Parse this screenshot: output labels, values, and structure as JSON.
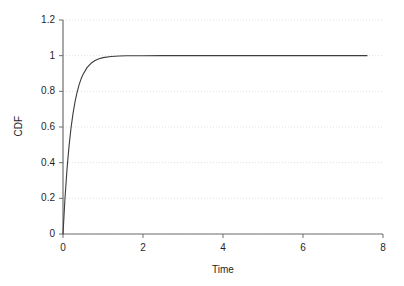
{
  "chart_data": {
    "type": "line",
    "title": "",
    "subtitle": "",
    "xlabel": "Time",
    "ylabel": "CDF",
    "xlim": [
      0,
      8
    ],
    "ylim": [
      0,
      1.2
    ],
    "xticks": [
      0,
      2,
      4,
      6,
      8
    ],
    "xtick_labels": [
      "0",
      "2",
      "4",
      "6",
      "8"
    ],
    "yticks": [
      0,
      0.2,
      0.4,
      0.6,
      0.8,
      1,
      1.2
    ],
    "ytick_labels": [
      "0",
      "0.2",
      "0.4",
      "0.6",
      "0.8",
      "1",
      "1.2"
    ],
    "grid": {
      "horizontal": true,
      "vertical": false,
      "style": "dotted",
      "color": "#d9d9d9"
    },
    "legend": {
      "visible": false,
      "position": "none",
      "entries": []
    },
    "annotations": [],
    "series": [
      {
        "name": "CDF",
        "color": "#3c3c3c",
        "line_width": 1.1,
        "formula": "1 - exp(-4.5 * t)",
        "x": [
          0,
          0.05,
          0.1,
          0.15,
          0.2,
          0.25,
          0.3,
          0.35,
          0.4,
          0.45,
          0.5,
          0.6,
          0.7,
          0.8,
          0.9,
          1,
          1.2,
          1.4,
          1.6,
          1.8,
          2,
          2.5,
          3,
          3.5,
          4,
          4.5,
          5,
          5.5,
          6,
          6.5,
          7,
          7.6
        ],
        "y": [
          0,
          0.2014,
          0.3624,
          0.4914,
          0.5934,
          0.6753,
          0.7408,
          0.7932,
          0.8352,
          0.8687,
          0.8946,
          0.9328,
          0.9571,
          0.9727,
          0.9826,
          0.9889,
          0.9955,
          0.9982,
          0.9993,
          0.9997,
          0.9999,
          1,
          1,
          1,
          1,
          1,
          1,
          1,
          1,
          1,
          1,
          1
        ]
      }
    ]
  },
  "axes": {
    "axis_color": "#6e6e6e",
    "tick_color": "#6e6e6e",
    "background": "#ffffff"
  }
}
